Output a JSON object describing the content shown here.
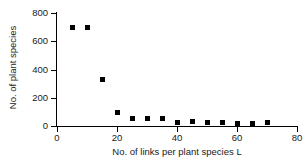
{
  "chart_data": {
    "type": "scatter",
    "title": "",
    "xlabel": "No. of links per plant species L",
    "ylabel": "No. of plant species",
    "xlim": [
      0,
      80
    ],
    "ylim": [
      0,
      800
    ],
    "xticks": [
      0,
      20,
      40,
      60,
      80
    ],
    "yticks": [
      0,
      200,
      400,
      600,
      800
    ],
    "xtick_labels": [
      "0",
      "20",
      "40",
      "60",
      "80"
    ],
    "ytick_labels": [
      "0",
      "200",
      "400",
      "600",
      "800"
    ],
    "grid": false,
    "legend": null,
    "marker": {
      "shape": "square",
      "color": "#000000",
      "size_px": 5
    },
    "x": [
      5,
      10,
      15,
      20,
      25,
      30,
      35,
      40,
      45,
      50,
      55,
      60,
      65,
      70
    ],
    "y": [
      695,
      700,
      330,
      95,
      55,
      55,
      50,
      25,
      30,
      22,
      22,
      15,
      18,
      22
    ],
    "points": [
      {
        "x": 5,
        "y": 695
      },
      {
        "x": 10,
        "y": 700
      },
      {
        "x": 15,
        "y": 330
      },
      {
        "x": 20,
        "y": 95
      },
      {
        "x": 25,
        "y": 55
      },
      {
        "x": 30,
        "y": 55
      },
      {
        "x": 35,
        "y": 50
      },
      {
        "x": 40,
        "y": 25
      },
      {
        "x": 45,
        "y": 30
      },
      {
        "x": 50,
        "y": 22
      },
      {
        "x": 55,
        "y": 22
      },
      {
        "x": 60,
        "y": 15
      },
      {
        "x": 65,
        "y": 18
      },
      {
        "x": 70,
        "y": 22
      }
    ]
  }
}
